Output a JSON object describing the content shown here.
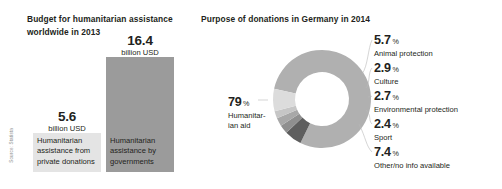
{
  "bar_panel": {
    "title": "Budget for humanitarian assistance\nworldwide in 2013",
    "source": "Source: Statista",
    "bars": [
      {
        "name": "private-donations",
        "value": "5.6",
        "unit": "billion USD",
        "caption": "Humanitarian\nassistance from\nprivate donations",
        "color": "#e4e4e4"
      },
      {
        "name": "governments",
        "value": "16.4",
        "unit": "billion USD",
        "caption": "Humanitarian\nassistance by\ngovernments",
        "color": "#9b9b9b"
      }
    ]
  },
  "donut_panel": {
    "title": "Purpose of donations in Germany in 2014",
    "percent_sign": "%"
  },
  "chart_data": [
    {
      "type": "bar",
      "title": "Budget for humanitarian assistance worldwide in 2013",
      "categories": [
        "Humanitarian assistance from private donations",
        "Humanitarian assistance by governments"
      ],
      "values": [
        5.6,
        16.4
      ],
      "unit": "billion USD",
      "xlabel": "",
      "ylabel": "billion USD",
      "ylim": [
        0,
        16.4
      ],
      "grid": false,
      "legend": "none",
      "colors": [
        "#e4e4e4",
        "#9b9b9b"
      ]
    },
    {
      "type": "pie",
      "subtype": "donut",
      "title": "Purpose of donations in Germany in 2014",
      "unit": "%",
      "labels": [
        "Humanitarian aid",
        "Animal protection",
        "Culture",
        "Environmental protection",
        "Sport",
        "Other/no info available"
      ],
      "values": [
        79,
        5.7,
        2.9,
        2.7,
        2.4,
        7.4
      ],
      "colors": [
        "#b0b0b0",
        "#5e5e5e",
        "#8f8f8f",
        "#a8a8a8",
        "#c6c6c6",
        "#dcdcdc"
      ],
      "legend": "callout-labels",
      "slices": [
        {
          "label": "Humanitarian aid",
          "display": "79",
          "name_text": "Humanitar-\nian aid",
          "value": 79,
          "color": "#b0b0b0"
        },
        {
          "label": "Animal protection",
          "display": "5.7",
          "name_text": "Animal protection",
          "value": 5.7,
          "color": "#5e5e5e"
        },
        {
          "label": "Culture",
          "display": "2.9",
          "name_text": "Culture",
          "value": 2.9,
          "color": "#8f8f8f"
        },
        {
          "label": "Environmental protection",
          "display": "2.7",
          "name_text": "Environmental protection",
          "value": 2.7,
          "color": "#a8a8a8"
        },
        {
          "label": "Sport",
          "display": "2.4",
          "name_text": "Sport",
          "value": 2.4,
          "color": "#c6c6c6"
        },
        {
          "label": "Other/no info available",
          "display": "7.4",
          "name_text": "Other/no info available",
          "value": 7.4,
          "color": "#dcdcdc"
        }
      ]
    }
  ]
}
